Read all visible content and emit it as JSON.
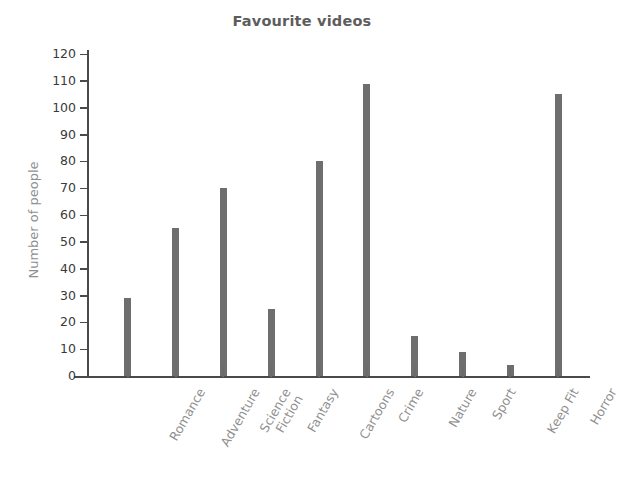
{
  "chart_data": {
    "type": "bar",
    "title": "Favourite videos",
    "xlabel": "",
    "ylabel": "Number of people",
    "categories": [
      "Romance",
      "Adventure",
      "Science\nFiction",
      "Fantasy",
      "Cartoons",
      "Crime",
      "Nature",
      "Sport",
      "Keep Fit",
      "Horror"
    ],
    "values": [
      29,
      55,
      70,
      25,
      80,
      109,
      15,
      9,
      4,
      105
    ],
    "ylim": [
      0,
      120
    ],
    "ytick_labels": [
      "0",
      "10",
      "20",
      "30",
      "40",
      "50",
      "60",
      "70",
      "80",
      "90",
      "100",
      "110",
      "120"
    ],
    "ytick_values": [
      0,
      10,
      20,
      30,
      40,
      50,
      60,
      70,
      80,
      90,
      100,
      110,
      120
    ],
    "grid": false,
    "legend": "none",
    "bar_color": "#6e6e6e",
    "axis_color": "#4a4a4a",
    "title_color": "#5d5d5d",
    "label_color": "#8f8f8f",
    "tick_label_color": "#3a3a3a",
    "background_color": "#ffffff"
  }
}
